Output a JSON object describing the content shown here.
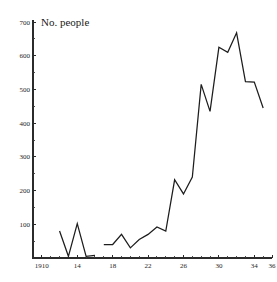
{
  "chart_data": {
    "type": "line",
    "title": "No. people",
    "xlabel": "",
    "ylabel": "",
    "xlim": [
      1909,
      1936
    ],
    "ylim": [
      0,
      700
    ],
    "grid": false,
    "legend": false,
    "y_ticks": [
      100,
      200,
      300,
      400,
      500,
      600,
      700
    ],
    "y_tick_labels": [
      "100",
      "200",
      "300",
      "400",
      "500",
      "600",
      "700"
    ],
    "x_ticks": [
      1910,
      1914,
      1918,
      1922,
      1926,
      1930,
      1934,
      1936
    ],
    "x_tick_labels": [
      "1910",
      "14",
      "18",
      "22",
      "26",
      "30",
      "34",
      "36"
    ],
    "x_minor_ticks": [
      1911,
      1912,
      1913,
      1915,
      1916,
      1917,
      1919,
      1920,
      1921,
      1923,
      1924,
      1925,
      1927,
      1928,
      1929,
      1931,
      1932,
      1933,
      1935
    ],
    "series": [
      {
        "name": "No. people",
        "segments": [
          {
            "x": [
              1912,
              1913,
              1914,
              1915,
              1916
            ],
            "values": [
              80,
              5,
              102,
              5,
              8
            ]
          },
          {
            "x": [
              1917,
              1918,
              1919,
              1920,
              1921,
              1922,
              1923,
              1924,
              1925,
              1926,
              1927,
              1928,
              1929,
              1930,
              1931,
              1932,
              1933,
              1934,
              1935
            ],
            "values": [
              40,
              40,
              70,
              30,
              55,
              70,
              92,
              80,
              232,
              190,
              240,
              515,
              435,
              625,
              610,
              668,
              523,
              522,
              445
            ]
          }
        ]
      }
    ]
  },
  "axes": {
    "title_anchor": "top-left-of-plot"
  }
}
